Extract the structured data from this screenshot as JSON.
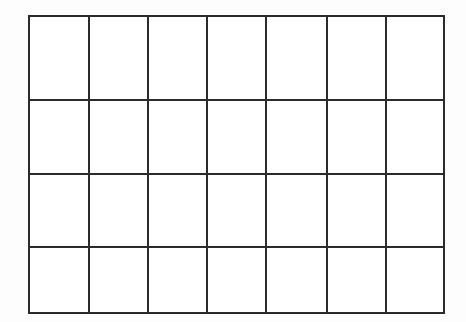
{
  "figure": {
    "kind": "blank-grid",
    "rows": 4,
    "columns": 7,
    "cell_count": 28,
    "has_header_row": false,
    "has_content": false,
    "line_color": "#2b2b2b",
    "cell_fill_color": "#ffffff",
    "background_color": "#fdfdfd",
    "line_width_px": 2,
    "bounds": {
      "left": 28,
      "top": 15,
      "right": 443,
      "bottom": 312,
      "width": 415,
      "height": 297
    },
    "column_widths_px": [
      60,
      59,
      59,
      59,
      61,
      59,
      58
    ],
    "row_heights_px": [
      84,
      74,
      73,
      66
    ],
    "vertical_line_x_px": [
      28,
      88,
      147,
      206,
      265,
      326,
      385,
      443
    ],
    "horizontal_line_y_px": [
      15,
      99,
      173,
      246,
      312
    ]
  },
  "grid": {
    "rows": [
      {
        "cells": [
          "",
          "",
          "",
          "",
          "",
          "",
          ""
        ]
      },
      {
        "cells": [
          "",
          "",
          "",
          "",
          "",
          "",
          ""
        ]
      },
      {
        "cells": [
          "",
          "",
          "",
          "",
          "",
          "",
          ""
        ]
      },
      {
        "cells": [
          "",
          "",
          "",
          "",
          "",
          "",
          ""
        ]
      }
    ]
  }
}
